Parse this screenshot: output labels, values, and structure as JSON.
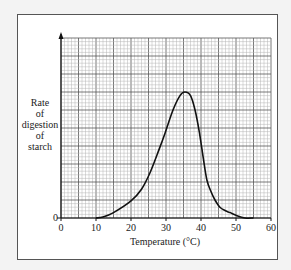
{
  "chart_data": {
    "type": "line",
    "title": "",
    "xlabel": "Temperature (°C)",
    "ylabel": [
      "Rate",
      "of",
      "digestion",
      "of",
      "starch"
    ],
    "xlim": [
      0,
      60
    ],
    "ylim": [
      0,
      100
    ],
    "x_ticks": [
      0,
      10,
      20,
      30,
      40,
      50,
      60
    ],
    "y_ticks": [
      0
    ],
    "grid": true,
    "legend": null,
    "series": [
      {
        "name": "Rate of digestion of starch",
        "x": [
          10,
          12,
          15,
          20,
          23,
          25.4,
          28,
          29.7,
          32,
          34,
          35.4,
          37,
          38.3,
          39.5,
          40.6,
          41.7,
          43,
          44,
          45.4,
          47,
          48.3,
          50,
          52.6,
          55
        ],
        "y": [
          0,
          0.5,
          3,
          9.5,
          16,
          25,
          38,
          47,
          60,
          68,
          70,
          68,
          60,
          48,
          34,
          21,
          14,
          10,
          6,
          4,
          3,
          1.5,
          0,
          0
        ]
      }
    ],
    "color": "#111111"
  }
}
